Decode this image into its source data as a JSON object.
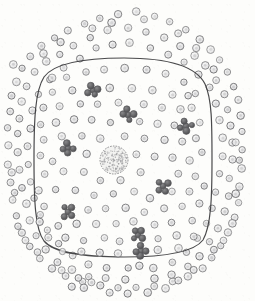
{
  "figure": {
    "caption": "",
    "canvas": {
      "width": 255,
      "height": 301
    },
    "background_color": "#fdfdfb"
  },
  "colors": {
    "granule_stroke": "#6e6e70",
    "granule_fill": "#e9e9ea",
    "granule_inner": "#c9c9cb",
    "membrane_stroke": "#3a3a3c",
    "cluster_dark": "#58585a",
    "nucleolus_stroke": "#808082",
    "nucleolus_stipple": "#9a9a9c",
    "paper": "#fdfdfb"
  },
  "membrane": {
    "name": "nuclear-envelope",
    "stroke_width": 1.2,
    "bounds": {
      "left": 34,
      "top": 58,
      "right": 212,
      "bottom": 257
    },
    "path": "M 124 58 C 168 58 196 66 205 84 C 212 99 212 124 212 160 C 212 198 211 226 203 240 C 194 252 168 257 124 257 C 82 257 54 253 44 241 C 35 229 34 200 34 160 C 34 120 35 91 44 77 C 54 63 82 58 124 58 Z"
  },
  "nucleolus": {
    "name": "nucleolus",
    "cx": 114,
    "cy": 160,
    "r": 14,
    "stipple_count": 150,
    "label": "nucleolus"
  },
  "granule": {
    "name": "ribosome-granule",
    "r_outer": 3.5,
    "r_inner": 1.5,
    "stroke_width": 0.9
  },
  "cluster": {
    "name": "polysome-cluster",
    "dot_r": 3.2,
    "dot_count": 5
  },
  "clusters": [
    {
      "cx": 93,
      "cy": 90
    },
    {
      "cx": 128,
      "cy": 115
    },
    {
      "cx": 186,
      "cy": 126
    },
    {
      "cx": 68,
      "cy": 148
    },
    {
      "cx": 163,
      "cy": 186
    },
    {
      "cx": 68,
      "cy": 212
    },
    {
      "cx": 138,
      "cy": 235
    },
    {
      "cx": 141,
      "cy": 251
    }
  ],
  "granules_inside": [
    {
      "cx": 66,
      "cy": 78
    },
    {
      "cx": 86,
      "cy": 72
    },
    {
      "cx": 104,
      "cy": 70
    },
    {
      "cx": 124,
      "cy": 68
    },
    {
      "cx": 146,
      "cy": 70
    },
    {
      "cx": 166,
      "cy": 74
    },
    {
      "cx": 184,
      "cy": 82
    },
    {
      "cx": 196,
      "cy": 94
    },
    {
      "cx": 52,
      "cy": 92
    },
    {
      "cx": 72,
      "cy": 90
    },
    {
      "cx": 110,
      "cy": 88
    },
    {
      "cx": 132,
      "cy": 88
    },
    {
      "cx": 152,
      "cy": 90
    },
    {
      "cx": 172,
      "cy": 94
    },
    {
      "cx": 192,
      "cy": 108
    },
    {
      "cx": 44,
      "cy": 108
    },
    {
      "cx": 60,
      "cy": 106
    },
    {
      "cx": 80,
      "cy": 104
    },
    {
      "cx": 98,
      "cy": 104
    },
    {
      "cx": 118,
      "cy": 102
    },
    {
      "cx": 144,
      "cy": 104
    },
    {
      "cx": 162,
      "cy": 108
    },
    {
      "cx": 180,
      "cy": 110
    },
    {
      "cx": 200,
      "cy": 122
    },
    {
      "cx": 40,
      "cy": 124
    },
    {
      "cx": 56,
      "cy": 122
    },
    {
      "cx": 74,
      "cy": 120
    },
    {
      "cx": 92,
      "cy": 120
    },
    {
      "cx": 110,
      "cy": 122
    },
    {
      "cx": 140,
      "cy": 122
    },
    {
      "cx": 158,
      "cy": 124
    },
    {
      "cx": 174,
      "cy": 126
    },
    {
      "cx": 196,
      "cy": 138
    },
    {
      "cx": 44,
      "cy": 140
    },
    {
      "cx": 62,
      "cy": 136
    },
    {
      "cx": 82,
      "cy": 136
    },
    {
      "cx": 100,
      "cy": 138
    },
    {
      "cx": 124,
      "cy": 136
    },
    {
      "cx": 144,
      "cy": 138
    },
    {
      "cx": 164,
      "cy": 140
    },
    {
      "cx": 182,
      "cy": 142
    },
    {
      "cx": 202,
      "cy": 152
    },
    {
      "cx": 40,
      "cy": 156
    },
    {
      "cx": 52,
      "cy": 162
    },
    {
      "cx": 86,
      "cy": 154
    },
    {
      "cx": 136,
      "cy": 154
    },
    {
      "cx": 154,
      "cy": 156
    },
    {
      "cx": 172,
      "cy": 158
    },
    {
      "cx": 190,
      "cy": 160
    },
    {
      "cx": 44,
      "cy": 174
    },
    {
      "cx": 64,
      "cy": 172
    },
    {
      "cx": 84,
      "cy": 172
    },
    {
      "cx": 100,
      "cy": 180
    },
    {
      "cx": 120,
      "cy": 180
    },
    {
      "cx": 140,
      "cy": 172
    },
    {
      "cx": 178,
      "cy": 174
    },
    {
      "cx": 196,
      "cy": 176
    },
    {
      "cx": 38,
      "cy": 190
    },
    {
      "cx": 56,
      "cy": 190
    },
    {
      "cx": 76,
      "cy": 190
    },
    {
      "cx": 94,
      "cy": 196
    },
    {
      "cx": 114,
      "cy": 194
    },
    {
      "cx": 134,
      "cy": 192
    },
    {
      "cx": 150,
      "cy": 198
    },
    {
      "cx": 172,
      "cy": 192
    },
    {
      "cx": 190,
      "cy": 192
    },
    {
      "cx": 204,
      "cy": 186
    },
    {
      "cx": 44,
      "cy": 206
    },
    {
      "cx": 88,
      "cy": 210
    },
    {
      "cx": 106,
      "cy": 208
    },
    {
      "cx": 126,
      "cy": 208
    },
    {
      "cx": 144,
      "cy": 212
    },
    {
      "cx": 164,
      "cy": 208
    },
    {
      "cx": 182,
      "cy": 206
    },
    {
      "cx": 200,
      "cy": 204
    },
    {
      "cx": 40,
      "cy": 222
    },
    {
      "cx": 58,
      "cy": 226
    },
    {
      "cx": 76,
      "cy": 224
    },
    {
      "cx": 96,
      "cy": 224
    },
    {
      "cx": 116,
      "cy": 224
    },
    {
      "cx": 134,
      "cy": 222
    },
    {
      "cx": 154,
      "cy": 224
    },
    {
      "cx": 172,
      "cy": 222
    },
    {
      "cx": 192,
      "cy": 220
    },
    {
      "cx": 48,
      "cy": 238
    },
    {
      "cx": 66,
      "cy": 238
    },
    {
      "cx": 84,
      "cy": 240
    },
    {
      "cx": 104,
      "cy": 238
    },
    {
      "cx": 120,
      "cy": 242
    },
    {
      "cx": 158,
      "cy": 238
    },
    {
      "cx": 176,
      "cy": 236
    },
    {
      "cx": 194,
      "cy": 236
    },
    {
      "cx": 62,
      "cy": 252
    },
    {
      "cx": 82,
      "cy": 252
    },
    {
      "cx": 100,
      "cy": 252
    },
    {
      "cx": 118,
      "cy": 254
    },
    {
      "cx": 158,
      "cy": 250
    },
    {
      "cx": 178,
      "cy": 248
    },
    {
      "cx": 52,
      "cy": 78
    },
    {
      "cx": 188,
      "cy": 96
    }
  ],
  "granules_outside": [
    {
      "cx": 118,
      "cy": 14
    },
    {
      "cx": 136,
      "cy": 12
    },
    {
      "cx": 100,
      "cy": 18
    },
    {
      "cx": 154,
      "cy": 16
    },
    {
      "cx": 84,
      "cy": 24
    },
    {
      "cx": 170,
      "cy": 22
    },
    {
      "cx": 68,
      "cy": 30
    },
    {
      "cx": 186,
      "cy": 30
    },
    {
      "cx": 54,
      "cy": 38
    },
    {
      "cx": 200,
      "cy": 40
    },
    {
      "cx": 42,
      "cy": 46
    },
    {
      "cx": 210,
      "cy": 50
    },
    {
      "cx": 30,
      "cy": 56
    },
    {
      "cx": 220,
      "cy": 60
    },
    {
      "cx": 22,
      "cy": 68
    },
    {
      "cx": 228,
      "cy": 72
    },
    {
      "cx": 16,
      "cy": 82
    },
    {
      "cx": 234,
      "cy": 86
    },
    {
      "cx": 12,
      "cy": 96
    },
    {
      "cx": 238,
      "cy": 100
    },
    {
      "cx": 10,
      "cy": 112
    },
    {
      "cx": 240,
      "cy": 116
    },
    {
      "cx": 8,
      "cy": 128
    },
    {
      "cx": 242,
      "cy": 132
    },
    {
      "cx": 8,
      "cy": 146
    },
    {
      "cx": 242,
      "cy": 150
    },
    {
      "cx": 8,
      "cy": 164
    },
    {
      "cx": 242,
      "cy": 168
    },
    {
      "cx": 10,
      "cy": 182
    },
    {
      "cx": 240,
      "cy": 186
    },
    {
      "cx": 12,
      "cy": 200
    },
    {
      "cx": 238,
      "cy": 202
    },
    {
      "cx": 16,
      "cy": 216
    },
    {
      "cx": 234,
      "cy": 218
    },
    {
      "cx": 22,
      "cy": 232
    },
    {
      "cx": 228,
      "cy": 232
    },
    {
      "cx": 30,
      "cy": 246
    },
    {
      "cx": 220,
      "cy": 246
    },
    {
      "cx": 40,
      "cy": 258
    },
    {
      "cx": 212,
      "cy": 258
    },
    {
      "cx": 52,
      "cy": 268
    },
    {
      "cx": 202,
      "cy": 268
    },
    {
      "cx": 66,
      "cy": 276
    },
    {
      "cx": 188,
      "cy": 276
    },
    {
      "cx": 82,
      "cy": 282
    },
    {
      "cx": 172,
      "cy": 282
    },
    {
      "cx": 100,
      "cy": 286
    },
    {
      "cx": 154,
      "cy": 286
    },
    {
      "cx": 118,
      "cy": 288
    },
    {
      "cx": 136,
      "cy": 288
    },
    {
      "cx": 108,
      "cy": 30
    },
    {
      "cx": 128,
      "cy": 28
    },
    {
      "cx": 90,
      "cy": 38
    },
    {
      "cx": 146,
      "cy": 32
    },
    {
      "cx": 74,
      "cy": 46
    },
    {
      "cx": 164,
      "cy": 38
    },
    {
      "cx": 60,
      "cy": 54
    },
    {
      "cx": 180,
      "cy": 46
    },
    {
      "cx": 46,
      "cy": 62
    },
    {
      "cx": 194,
      "cy": 56
    },
    {
      "cx": 34,
      "cy": 72
    },
    {
      "cx": 206,
      "cy": 66
    },
    {
      "cx": 26,
      "cy": 86
    },
    {
      "cx": 216,
      "cy": 80
    },
    {
      "cx": 22,
      "cy": 102
    },
    {
      "cx": 224,
      "cy": 94
    },
    {
      "cx": 20,
      "cy": 118
    },
    {
      "cx": 228,
      "cy": 110
    },
    {
      "cx": 18,
      "cy": 134
    },
    {
      "cx": 230,
      "cy": 126
    },
    {
      "cx": 18,
      "cy": 152
    },
    {
      "cx": 232,
      "cy": 142
    },
    {
      "cx": 20,
      "cy": 170
    },
    {
      "cx": 232,
      "cy": 160
    },
    {
      "cx": 22,
      "cy": 188
    },
    {
      "cx": 230,
      "cy": 178
    },
    {
      "cx": 26,
      "cy": 204
    },
    {
      "cx": 228,
      "cy": 196
    },
    {
      "cx": 30,
      "cy": 220
    },
    {
      "cx": 224,
      "cy": 212
    },
    {
      "cx": 36,
      "cy": 236
    },
    {
      "cx": 218,
      "cy": 228
    },
    {
      "cx": 46,
      "cy": 250
    },
    {
      "cx": 210,
      "cy": 242
    },
    {
      "cx": 58,
      "cy": 262
    },
    {
      "cx": 200,
      "cy": 256
    },
    {
      "cx": 72,
      "cy": 270
    },
    {
      "cx": 188,
      "cy": 266
    },
    {
      "cx": 88,
      "cy": 276
    },
    {
      "cx": 172,
      "cy": 274
    },
    {
      "cx": 106,
      "cy": 278
    },
    {
      "cx": 154,
      "cy": 278
    },
    {
      "cx": 126,
      "cy": 280
    },
    {
      "cx": 96,
      "cy": 48
    },
    {
      "cx": 112,
      "cy": 44
    },
    {
      "cx": 130,
      "cy": 42
    },
    {
      "cx": 150,
      "cy": 48
    },
    {
      "cx": 80,
      "cy": 58
    },
    {
      "cx": 168,
      "cy": 54
    },
    {
      "cx": 64,
      "cy": 68
    },
    {
      "cx": 184,
      "cy": 62
    },
    {
      "cx": 50,
      "cy": 80
    },
    {
      "cx": 198,
      "cy": 74
    },
    {
      "cx": 38,
      "cy": 94
    },
    {
      "cx": 210,
      "cy": 88
    },
    {
      "cx": 32,
      "cy": 110
    },
    {
      "cx": 216,
      "cy": 104
    },
    {
      "cx": 30,
      "cy": 128
    },
    {
      "cx": 220,
      "cy": 120
    },
    {
      "cx": 28,
      "cy": 146
    },
    {
      "cx": 222,
      "cy": 138
    },
    {
      "cx": 28,
      "cy": 164
    },
    {
      "cx": 222,
      "cy": 156
    },
    {
      "cx": 30,
      "cy": 182
    },
    {
      "cx": 220,
      "cy": 174
    },
    {
      "cx": 34,
      "cy": 198
    },
    {
      "cx": 216,
      "cy": 192
    },
    {
      "cx": 40,
      "cy": 214
    },
    {
      "cx": 212,
      "cy": 208
    },
    {
      "cx": 48,
      "cy": 230
    },
    {
      "cx": 206,
      "cy": 224
    },
    {
      "cx": 58,
      "cy": 244
    },
    {
      "cx": 198,
      "cy": 238
    },
    {
      "cx": 72,
      "cy": 256
    },
    {
      "cx": 186,
      "cy": 252
    },
    {
      "cx": 88,
      "cy": 264
    },
    {
      "cx": 172,
      "cy": 262
    },
    {
      "cx": 106,
      "cy": 268
    },
    {
      "cx": 154,
      "cy": 268
    },
    {
      "cx": 128,
      "cy": 268
    },
    {
      "cx": 140,
      "cy": 266
    },
    {
      "cx": 144,
      "cy": 20
    },
    {
      "cx": 112,
      "cy": 22
    },
    {
      "cx": 92,
      "cy": 28
    },
    {
      "cx": 178,
      "cy": 34
    },
    {
      "cx": 60,
      "cy": 42
    },
    {
      "cx": 196,
      "cy": 48
    },
    {
      "cx": 44,
      "cy": 54
    },
    {
      "cx": 214,
      "cy": 70
    },
    {
      "cx": 14,
      "cy": 64
    },
    {
      "cx": 236,
      "cy": 142
    },
    {
      "cx": 12,
      "cy": 172
    },
    {
      "cx": 240,
      "cy": 160
    },
    {
      "cx": 14,
      "cy": 192
    },
    {
      "cx": 236,
      "cy": 194
    },
    {
      "cx": 18,
      "cy": 226
    },
    {
      "cx": 232,
      "cy": 224
    },
    {
      "cx": 26,
      "cy": 240
    },
    {
      "cx": 224,
      "cy": 240
    },
    {
      "cx": 38,
      "cy": 252
    },
    {
      "cx": 214,
      "cy": 250
    },
    {
      "cx": 62,
      "cy": 270
    },
    {
      "cx": 194,
      "cy": 270
    },
    {
      "cx": 78,
      "cy": 278
    },
    {
      "cx": 178,
      "cy": 280
    },
    {
      "cx": 92,
      "cy": 282
    },
    {
      "cx": 166,
      "cy": 288
    },
    {
      "cx": 110,
      "cy": 292
    },
    {
      "cx": 148,
      "cy": 292
    },
    {
      "cx": 128,
      "cy": 294
    },
    {
      "cx": 84,
      "cy": 288
    },
    {
      "cx": 72,
      "cy": 286
    }
  ]
}
